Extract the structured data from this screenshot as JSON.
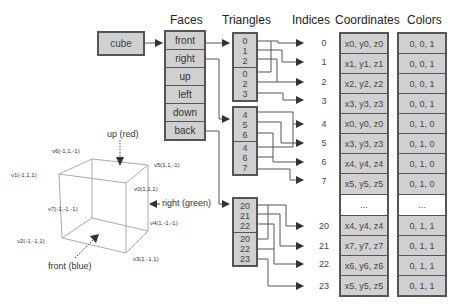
{
  "headers": {
    "faces": "Faces",
    "triangles": "Triangles",
    "indices": "Indices",
    "coordinates": "Coordinates",
    "colors": "Colors"
  },
  "cube_label": "cube",
  "faces": [
    "front",
    "right",
    "up",
    "left",
    "down",
    "back"
  ],
  "triangle_groups": [
    {
      "face": "front",
      "tri1": [
        "0",
        "1",
        "2"
      ],
      "tri2": [
        "0",
        "2",
        "3"
      ]
    },
    {
      "face": "right",
      "tri1": [
        "4",
        "5",
        "6"
      ],
      "tri2": [
        "4",
        "6",
        "7"
      ]
    },
    {
      "face": "back",
      "tri1": [
        "20",
        "21",
        "22"
      ],
      "tri2": [
        "20",
        "22",
        "23"
      ]
    }
  ],
  "indices": [
    "0",
    "1",
    "2",
    "3",
    "4",
    "5",
    "6",
    "7",
    "20",
    "21",
    "22",
    "23"
  ],
  "coordinates": [
    "x0, y0, z0",
    "x1, y1, z1",
    "x2, y2, z2",
    "x3, y3, z3",
    "x0, y0, z0",
    "x3, y3, z3",
    "x4, y4, z4",
    "x5, y5, z5",
    "...",
    "x4, y4, z4",
    "x7, y7, z7",
    "x6, y6, z6",
    "x5, y5, z5"
  ],
  "colors": [
    "0, 0, 1",
    "0, 0, 1",
    "0, 0, 1",
    "0, 0, 1",
    "0, 1, 0",
    "0, 1, 0",
    "0, 1, 0",
    "0, 1, 0",
    "...",
    "0, 1, 1",
    "0, 1, 1",
    "0, 1, 1",
    "0, 1, 1"
  ],
  "cube_vertices": {
    "v0": "v0(1,1,1)",
    "v1": "v1(-1,1,1)",
    "v2": "v2(-1,-1,1)",
    "v3": "v3(1,-1,1)",
    "v4": "v4(1,-1,-1)",
    "v5": "v5(1,1,-1)",
    "v6": "v6(-1,1,-1)",
    "v7": "v7(-1,-1,-1)"
  },
  "directions": {
    "up": "up (red)",
    "right": "right (green)",
    "front": "front (blue)"
  }
}
